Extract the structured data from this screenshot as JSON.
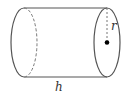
{
  "diagram": {
    "type": "cylinder",
    "labels": {
      "radius": "r",
      "height": "h"
    },
    "colors": {
      "stroke": "#555555",
      "dot": "#000000"
    }
  }
}
